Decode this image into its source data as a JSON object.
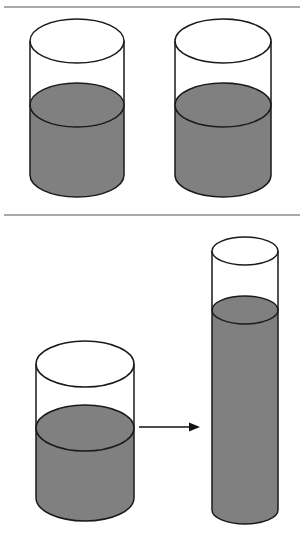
{
  "figure": {
    "width": 303,
    "height": 537,
    "background_color": "#ffffff"
  },
  "colors": {
    "liquid_fill": "#808080",
    "outline_stroke": "#1a1a1a",
    "divider_stroke": "#8c8c8c",
    "arrow_stroke": "#111111",
    "glass_empty_fill": "#ffffff"
  },
  "dividers": [
    {
      "name": "top-divider",
      "y": 7,
      "x1": 4,
      "x2": 300,
      "thickness": 1.6
    },
    {
      "name": "middle-divider",
      "y": 215,
      "x1": 4,
      "x2": 300,
      "thickness": 1.6
    }
  ],
  "panels": [
    {
      "id": "panel-identical-pair",
      "label": "Two identical wide beakers with equal liquid levels",
      "vessels": [
        {
          "id": "beaker-left-top",
          "label": "Left identical beaker",
          "shape": "wide-cylinder",
          "cx": 77,
          "rx": 47,
          "ry": 22,
          "top_y": 41,
          "bottom_y": 175,
          "liquid_y": 105,
          "fill_level_fraction": 0.52,
          "liquid_color": "#808080"
        },
        {
          "id": "beaker-right-top",
          "label": "Right identical beaker",
          "shape": "wide-cylinder",
          "cx": 223,
          "rx": 48,
          "ry": 22,
          "top_y": 41,
          "bottom_y": 175,
          "liquid_y": 105,
          "fill_level_fraction": 0.52,
          "liquid_color": "#808080"
        }
      ]
    },
    {
      "id": "panel-transfer",
      "label": "Liquid poured from a wide beaker into a tall narrow cylinder",
      "vessels": [
        {
          "id": "beaker-wide-bottom",
          "label": "Wide source beaker",
          "shape": "wide-cylinder",
          "cx": 85,
          "rx": 49,
          "ry": 23,
          "top_y": 364,
          "bottom_y": 498,
          "liquid_y": 428,
          "fill_level_fraction": 0.52,
          "liquid_color": "#808080"
        },
        {
          "id": "cylinder-tall-bottom",
          "label": "Tall narrow receiving cylinder",
          "shape": "tall-cylinder",
          "cx": 245,
          "rx": 33,
          "ry": 14,
          "top_y": 251,
          "bottom_y": 510,
          "liquid_y": 310,
          "fill_level_fraction": 0.77,
          "liquid_color": "#808080"
        }
      ],
      "arrow": {
        "id": "transfer-arrow",
        "label": "Pour direction arrow",
        "x_start": 139,
        "x_end": 200,
        "y": 427,
        "head_length": 11,
        "head_width": 9,
        "stroke_width": 1.6
      }
    }
  ]
}
